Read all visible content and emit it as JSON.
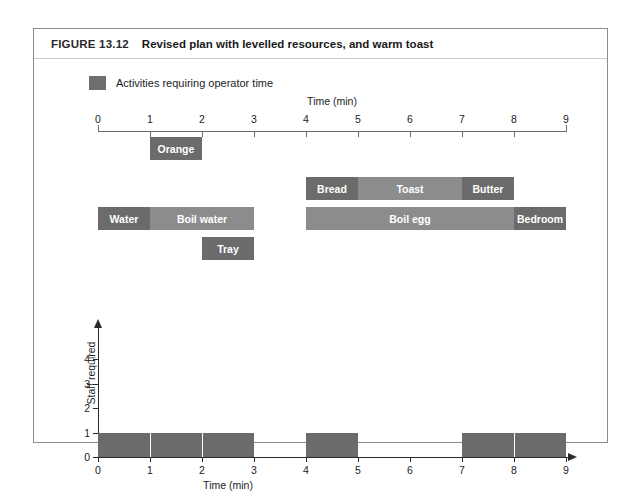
{
  "figure": {
    "label": "FIGURE 13.12",
    "title": "Revised plan with levelled resources, and warm toast"
  },
  "legend": {
    "swatch_color": "#6f6f6f",
    "text": "Activities requiring operator time"
  },
  "colors": {
    "operator_activity": "#6b6b6b",
    "passive_activity": "#8c8c8c",
    "axis": "#2a2a2a",
    "frame": "#8d8d8d"
  },
  "chart_data": {
    "type": "bar",
    "title": "Revised plan with levelled resources, and warm toast",
    "xlabel": "Time (min)",
    "ylabel": "Staff required",
    "xlim": [
      0,
      9
    ],
    "xticks": [
      0,
      1,
      2,
      3,
      4,
      5,
      6,
      7,
      8,
      9
    ],
    "grid": false,
    "legend_position": "top-left",
    "gantt": {
      "xlabel": "Time (min)",
      "rows": [
        {
          "row": 0,
          "tasks": [
            {
              "name": "Orange",
              "start": 1,
              "end": 2,
              "operator_time": true
            }
          ]
        },
        {
          "row": 1,
          "tasks": [
            {
              "name": "Bread",
              "start": 4,
              "end": 5,
              "operator_time": true
            },
            {
              "name": "Toast",
              "start": 5,
              "end": 7,
              "operator_time": false
            },
            {
              "name": "Butter",
              "start": 7,
              "end": 8,
              "operator_time": true
            }
          ]
        },
        {
          "row": 2,
          "tasks": [
            {
              "name": "Water",
              "start": 0,
              "end": 1,
              "operator_time": true
            },
            {
              "name": "Boil water",
              "start": 1,
              "end": 3,
              "operator_time": false
            },
            {
              "name": "Boil egg",
              "start": 4,
              "end": 8,
              "operator_time": false
            },
            {
              "name": "Bedroom",
              "start": 8,
              "end": 9,
              "operator_time": true
            }
          ]
        },
        {
          "row": 3,
          "tasks": [
            {
              "name": "Tray",
              "start": 2,
              "end": 3,
              "operator_time": true
            }
          ]
        }
      ]
    },
    "staff_histogram": {
      "xlabel": "Time (min)",
      "ylabel": "Staff required",
      "ylim": [
        0,
        4
      ],
      "yticks": [
        0,
        1,
        2,
        3,
        4
      ],
      "xticks": [
        0,
        1,
        2,
        3,
        4,
        5,
        6,
        7,
        8,
        9
      ],
      "categories": [
        "0-1",
        "1-2",
        "2-3",
        "3-4",
        "4-5",
        "5-6",
        "6-7",
        "7-8",
        "8-9"
      ],
      "values": [
        1,
        1,
        1,
        0,
        1,
        0,
        0,
        1,
        1
      ]
    }
  }
}
